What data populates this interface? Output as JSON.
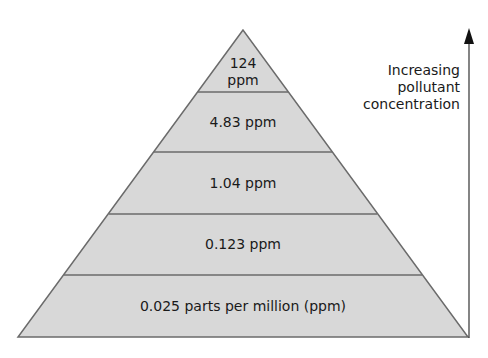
{
  "diagram": {
    "type": "pyramid",
    "fill_color": "#d8d8d8",
    "line_color": "#6b6b6b",
    "levels": [
      {
        "label_line1": "124",
        "label_line2": "ppm"
      },
      {
        "label": "4.83 ppm"
      },
      {
        "label": "1.04 ppm"
      },
      {
        "label": "0.123 ppm"
      },
      {
        "label": "0.025 parts per million (ppm)"
      }
    ],
    "arrow": {
      "direction": "up",
      "label_lines": [
        "Increasing",
        "pollutant",
        "concentration"
      ]
    }
  }
}
